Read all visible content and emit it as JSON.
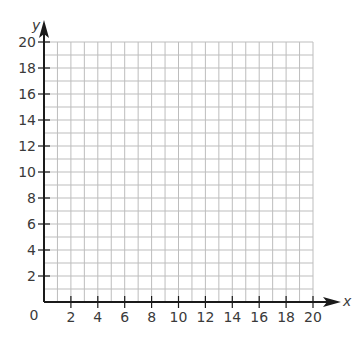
{
  "chart_data": {
    "type": "scatter",
    "title": "",
    "xlabel": "x",
    "ylabel": "y",
    "xlim": [
      0,
      20
    ],
    "ylim": [
      0,
      20
    ],
    "grid": true,
    "grid_step": 1,
    "origin_label": "0",
    "x_ticks": [
      2,
      4,
      6,
      8,
      10,
      12,
      14,
      16,
      18,
      20
    ],
    "y_ticks": [
      2,
      4,
      6,
      8,
      10,
      12,
      14,
      16,
      18,
      20
    ],
    "x_tick_labels": [
      "2",
      "4",
      "6",
      "8",
      "10",
      "12",
      "14",
      "16",
      "18",
      "20"
    ],
    "y_tick_labels": [
      "2",
      "4",
      "6",
      "8",
      "10",
      "12",
      "14",
      "16",
      "18",
      "20"
    ],
    "series": [],
    "legend": null
  },
  "colors": {
    "grid": "#bdbdbd",
    "axis": "#1a1a1a",
    "text": "#3a3a3a"
  }
}
